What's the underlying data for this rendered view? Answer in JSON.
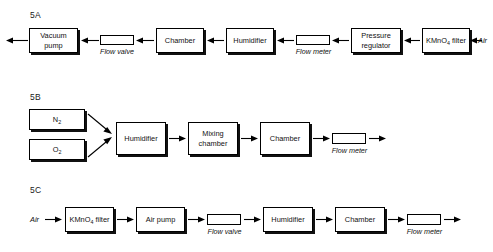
{
  "diagram": {
    "rows": [
      {
        "id": "5A",
        "label": "5A",
        "boxes": {
          "vacuum_pump": "Vacuum\npump",
          "vacuum_pump_l1": "Vacuum",
          "vacuum_pump_l2": "pump",
          "chamber": "Chamber",
          "humidifier": "Humidifier",
          "pressure_regulator_l1": "Pressure",
          "pressure_regulator_l2": "regulator",
          "kmno4_filter_pre": "KMnO",
          "kmno4_filter_sub": "4",
          "kmno4_filter_post": " filter"
        },
        "captions": {
          "flow_valve": "Flow valve",
          "flow_meter": "Flow meter"
        },
        "terminals": {
          "air": "Air"
        }
      },
      {
        "id": "5B",
        "label": "5B",
        "boxes": {
          "nitrogen_pre": "N",
          "nitrogen_sub": "2",
          "oxygen_pre": "O",
          "oxygen_sub": "2",
          "humidifier": "Humidifier",
          "mixing_chamber_l1": "Mixing",
          "mixing_chamber_l2": "chamber",
          "chamber": "Chamber"
        },
        "captions": {
          "flow_meter": "Flow meter"
        }
      },
      {
        "id": "5C",
        "label": "5C",
        "boxes": {
          "kmno4_filter_pre": "KMnO",
          "kmno4_filter_sub": "4",
          "kmno4_filter_post": " filter",
          "air_pump": "Air pump",
          "humidifier": "Humidifier",
          "chamber": "Chamber"
        },
        "captions": {
          "flow_valve": "Flow valve",
          "flow_meter": "Flow meter"
        },
        "terminals": {
          "air": "Air"
        }
      }
    ]
  },
  "colors": {
    "background": "#ffffff",
    "stroke": "#000000",
    "shadow": "#111111",
    "text": "#111111"
  }
}
